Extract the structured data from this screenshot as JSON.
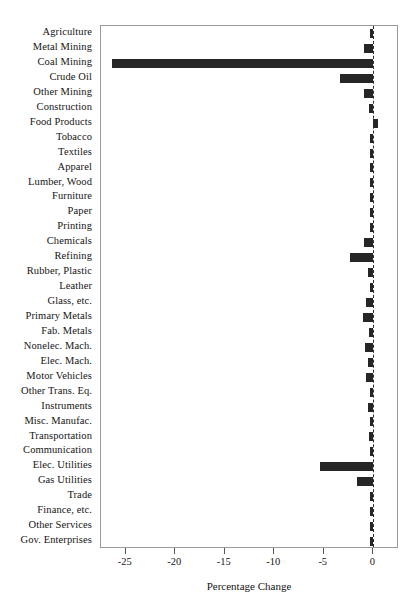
{
  "chart_data": {
    "type": "bar",
    "orientation": "horizontal",
    "title": "",
    "xlabel": "Percentage Change",
    "ylabel": "",
    "xlim": [
      -27.5,
      2.6
    ],
    "xticks": [
      -25,
      -20,
      -15,
      -10,
      -5,
      0
    ],
    "xticklabels": [
      "-25",
      "-20",
      "-15",
      "-10",
      "-5",
      "0"
    ],
    "grid": false,
    "legend": null,
    "zero_reference_line": true,
    "bar_color": "#262626",
    "categories": [
      "Agriculture",
      "Metal Mining",
      "Coal Mining",
      "Crude Oil",
      "Other Mining",
      "Construction",
      "Food Products",
      "Tobacco",
      "Textiles",
      "Apparel",
      "Lumber, Wood",
      "Furniture",
      "Paper",
      "Printing",
      "Chemicals",
      "Refining",
      "Rubber, Plastic",
      "Leather",
      "Glass, etc.",
      "Primary Metals",
      "Fab. Metals",
      "Nonelec. Mach.",
      "Elec. Mach.",
      "Motor Vehicles",
      "Other Trans. Eq.",
      "Instruments",
      "Misc. Manufac.",
      "Transportation",
      "Communication",
      "Elec. Utilities",
      "Gas Utilities",
      "Trade",
      "Finance, etc.",
      "Other Services",
      "Gov. Enterprises"
    ],
    "values": [
      -0.2,
      -0.9,
      -26.4,
      -3.4,
      -0.9,
      -0.4,
      0.5,
      -0.1,
      -0.2,
      -0.1,
      -0.2,
      -0.1,
      -0.3,
      -0.1,
      -0.9,
      -2.3,
      -0.5,
      -0.1,
      -0.7,
      -1.0,
      -0.4,
      -0.8,
      -0.5,
      -0.7,
      -0.3,
      -0.5,
      -0.2,
      -0.4,
      -0.1,
      -5.4,
      -1.6,
      -0.2,
      -0.1,
      -0.1,
      -0.2
    ]
  }
}
